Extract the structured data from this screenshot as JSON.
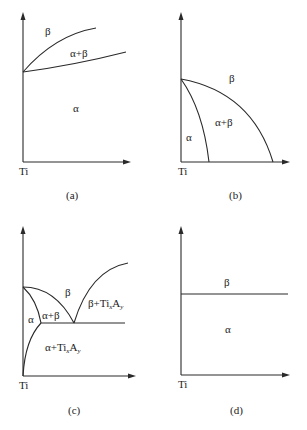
{
  "figure": {
    "panels": [
      {
        "id": "a",
        "caption": "(a)",
        "origin_label": "Ti",
        "regions": {
          "beta": "β",
          "alpha_beta": "α+β",
          "alpha": "α"
        },
        "description": "β-isomorphous: α+β field widening from Ti transus"
      },
      {
        "id": "b",
        "caption": "(b)",
        "origin_label": "Ti",
        "regions": {
          "beta": "β",
          "alpha_beta": "α+β",
          "alpha": "α"
        },
        "description": "β-stabilized: transus decreasing with alloy content"
      },
      {
        "id": "c",
        "caption": "(c)",
        "origin_label": "Ti",
        "regions": {
          "beta": "β",
          "alpha_beta": "α+β",
          "alpha": "α",
          "beta_compound_prefix": "β+Ti",
          "alpha_compound_prefix": "α+Ti",
          "sub_x": "x",
          "compound_A": "A",
          "sub_y": "y"
        },
        "description": "β-eutectoid with Ti_xA_y compound"
      },
      {
        "id": "d",
        "caption": "(d)",
        "origin_label": "Ti",
        "regions": {
          "beta": "β",
          "alpha": "α"
        },
        "description": "Neutral element: constant transus"
      }
    ]
  }
}
